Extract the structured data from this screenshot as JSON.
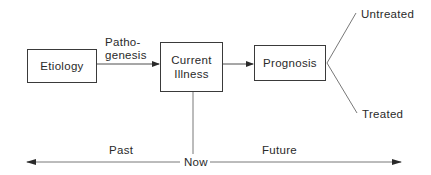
{
  "diagram": {
    "nodes": {
      "etiology": {
        "label": "Etiology"
      },
      "current_illness": {
        "line1": "Current",
        "line2": "Illness"
      },
      "prognosis": {
        "label": "Prognosis"
      }
    },
    "edge_labels": {
      "pathogenesis_line1": "Patho-",
      "pathogenesis_line2": "genesis"
    },
    "outcomes": {
      "untreated": "Untreated",
      "treated": "Treated"
    },
    "timeline": {
      "past": "Past",
      "now": "Now",
      "future": "Future"
    },
    "colors": {
      "stroke": "#3a3a3a",
      "text": "#2a2a2a",
      "background": "#ffffff"
    }
  }
}
